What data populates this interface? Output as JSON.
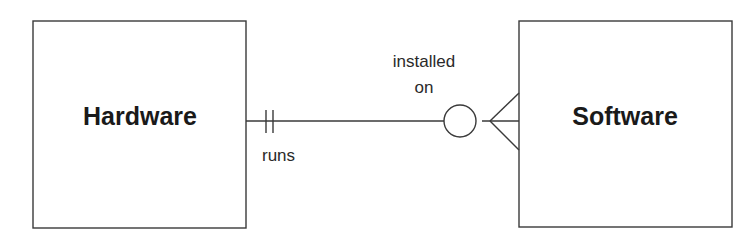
{
  "diagram": {
    "type": "entity-relationship",
    "entities": [
      {
        "id": "hardware",
        "label": "Hardware"
      },
      {
        "id": "software",
        "label": "Software"
      }
    ],
    "relationship": {
      "from": "hardware",
      "to": "software",
      "from_label": "runs",
      "to_label_line1": "installed",
      "to_label_line2": "on",
      "from_cardinality": "exactly one (mandatory one)",
      "to_cardinality": "zero or many (optional many)"
    },
    "colors": {
      "line": "#3a3a3a",
      "text": "#1a1a1a",
      "background": "#ffffff"
    }
  }
}
